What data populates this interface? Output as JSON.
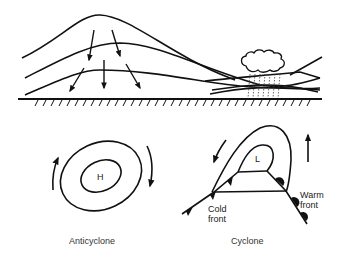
{
  "figure": {
    "top_panel": {
      "description": "Cross-section of airflow: descending air (high) on left, converging/ascending air with cloud and rain (low) on right",
      "ground": "hatched-ground"
    },
    "anticyclone": {
      "center_label": "H",
      "caption": "Anticyclone"
    },
    "cyclone": {
      "center_label": "L",
      "cold_front_label": "Cold\nfront",
      "warm_front_label": "Warm\nfront",
      "caption": "Cyclone"
    }
  }
}
